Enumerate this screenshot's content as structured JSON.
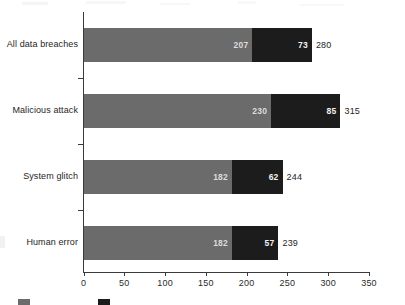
{
  "chart_data": {
    "type": "bar",
    "orientation": "horizontal",
    "stacked": true,
    "title": "",
    "subtitle": "",
    "xlabel": "",
    "ylabel": "",
    "xlim": [
      0,
      350
    ],
    "ylim": null,
    "grid": false,
    "legend_position": "bottom-left",
    "categories": [
      "All data breaches",
      "Malicious attack",
      "System glitch",
      "Human error"
    ],
    "xticks": [
      0,
      50,
      100,
      150,
      200,
      250,
      300,
      350
    ],
    "xtick_labels": [
      "0",
      "50",
      "100",
      "150",
      "200",
      "250",
      "300",
      "350"
    ],
    "series": [
      {
        "name": "",
        "color": "#6b6b6b",
        "values": [
          207,
          230,
          182,
          182
        ],
        "value_labels": [
          "207",
          "230",
          "182",
          "182"
        ]
      },
      {
        "name": "",
        "color": "#1c1c1c",
        "values": [
          73,
          85,
          62,
          57
        ],
        "value_labels": [
          "73",
          "85",
          "62",
          "57"
        ]
      }
    ],
    "totals": [
      280,
      315,
      244,
      239
    ],
    "total_labels": [
      "280",
      "315",
      "244",
      "239"
    ],
    "annotations": []
  },
  "legend": {
    "items": [
      {
        "label": "",
        "color": "#6b6b6b"
      },
      {
        "label": "",
        "color": "#1c1c1c"
      }
    ]
  }
}
